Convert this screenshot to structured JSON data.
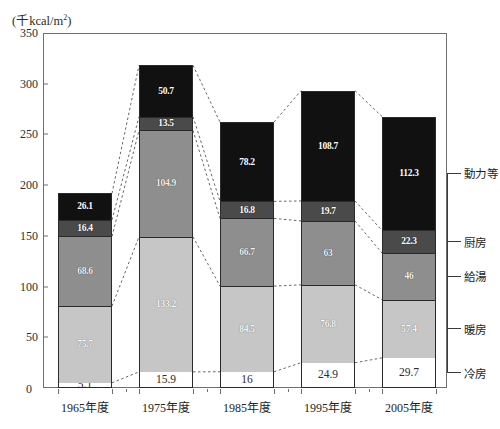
{
  "axis": {
    "unit_caption": "(千kcal/m",
    "unit_superscript": "2",
    "unit_caption_close": ")",
    "y_ticks": [
      "0",
      "50",
      "100",
      "150",
      "200",
      "250",
      "300",
      "350"
    ],
    "y_max": 350,
    "y_min": 0
  },
  "legend": {
    "items": [
      {
        "label": "動力等",
        "color": "#111111"
      },
      {
        "label": "厨房",
        "color": "#4a4a4a"
      },
      {
        "label": "給湯",
        "color": "#8e8e8e"
      },
      {
        "label": "暖房",
        "color": "#c6c6c6"
      },
      {
        "label": "冷房",
        "color": "#ffffff"
      }
    ]
  },
  "chart_data": {
    "type": "bar",
    "title": "",
    "xlabel": "",
    "ylabel": "(千kcal/m2)",
    "ylim": [
      0,
      350
    ],
    "stacked": true,
    "grid": false,
    "legend_position": "right",
    "categories": [
      "1965年度",
      "1975年度",
      "1985年度",
      "1995年度",
      "2005年度"
    ],
    "series": [
      {
        "name": "冷房",
        "color": "#ffffff",
        "values": [
          5.1,
          15.9,
          16,
          24.9,
          29.7
        ],
        "labels": [
          "5.1",
          "15.9",
          "16",
          "24.9",
          "29.7"
        ]
      },
      {
        "name": "暖房",
        "color": "#c6c6c6",
        "values": [
          75.7,
          133.2,
          84.5,
          76.8,
          57.4
        ],
        "labels": [
          "75.7",
          "133.2",
          "84.5",
          "76.8",
          "57.4"
        ]
      },
      {
        "name": "給湯",
        "color": "#8e8e8e",
        "values": [
          68.6,
          104.9,
          66.7,
          63,
          46
        ],
        "labels": [
          "68.6",
          "104.9",
          "66.7",
          "63",
          "46"
        ]
      },
      {
        "name": "厨房",
        "color": "#4a4a4a",
        "values": [
          16.4,
          13.5,
          16.8,
          19.7,
          22.3
        ],
        "labels": [
          "16.4",
          "13.5",
          "16.8",
          "19.7",
          "22.3"
        ]
      },
      {
        "name": "動力等",
        "color": "#111111",
        "values": [
          26.1,
          50.7,
          78.2,
          108.7,
          112.3
        ],
        "labels": [
          "26.1",
          "50.7",
          "78.2",
          "108.7",
          "112.3"
        ]
      }
    ],
    "totals": [
      191.9,
      318.2,
      262.2,
      293.1,
      267.7
    ]
  }
}
